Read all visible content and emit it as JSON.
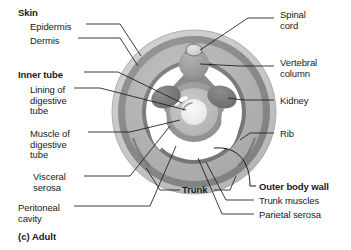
{
  "figure": {
    "caption": "(c) Adult",
    "center_label": "Trunk"
  },
  "colors": {
    "ink": "#1a1a1a",
    "skin_outer": "#c9c9c9",
    "dermis_band": "#8e8e8e",
    "trunk_muscle": "#b4b4b4",
    "parietal_serosa": "#7d7d7d",
    "peritoneal_cavity": "#ffffff",
    "visceral_serosa": "#9a9a9a",
    "digestive_muscle": "#bdbdbd",
    "digestive_lining": "#efefef",
    "organ_dark": "#7a7a7a",
    "vertebral_column": "#a0a0a0",
    "spinal_cord": "#d8d8d8",
    "background": "#ffffff"
  },
  "labels_left": [
    {
      "id": "skin",
      "text": "Skin",
      "bold": true,
      "x": 18,
      "y": 8
    },
    {
      "id": "epidermis",
      "text": "Epidermis",
      "bold": false,
      "x": 30,
      "y": 22
    },
    {
      "id": "dermis",
      "text": "Dermis",
      "bold": false,
      "x": 30,
      "y": 36
    },
    {
      "id": "inner-tube",
      "text": "Inner tube",
      "bold": true,
      "x": 18,
      "y": 70
    },
    {
      "id": "lining-of-digestive-tube",
      "text": "Lining of\ndigestive\ntube",
      "bold": false,
      "x": 30,
      "y": 85
    },
    {
      "id": "muscle-of-digestive-tube",
      "text": "Muscle of\ndigestive\ntube",
      "bold": false,
      "x": 30,
      "y": 129
    },
    {
      "id": "visceral-serosa",
      "text": "Visceral\nserosa",
      "bold": false,
      "x": 33,
      "y": 172
    },
    {
      "id": "peritoneal-cavity",
      "text": "Peritoneal\ncavity",
      "bold": false,
      "x": 18,
      "y": 203
    }
  ],
  "labels_right": [
    {
      "id": "spinal-cord",
      "text": "Spinal\ncord",
      "bold": false,
      "x": 280,
      "y": 10
    },
    {
      "id": "vertebral-column",
      "text": "Vertebral\ncolumn",
      "bold": false,
      "x": 280,
      "y": 58
    },
    {
      "id": "kidney",
      "text": "Kidney",
      "bold": false,
      "x": 280,
      "y": 96
    },
    {
      "id": "rib",
      "text": "Rib",
      "bold": false,
      "x": 280,
      "y": 129
    },
    {
      "id": "outer-body-wall",
      "text": "Outer body wall",
      "bold": true,
      "x": 259,
      "y": 182
    },
    {
      "id": "trunk-muscles",
      "text": "Trunk muscles",
      "bold": false,
      "x": 259,
      "y": 197
    },
    {
      "id": "parietal-serosa",
      "text": "Parietal serosa",
      "bold": false,
      "x": 259,
      "y": 211
    }
  ],
  "diagram": {
    "type": "anatomical-cross-section",
    "center": {
      "cx": 194,
      "cy": 112
    },
    "rings": [
      {
        "name": "skin-epidermis",
        "r": 82,
        "fill": "#c9c9c9"
      },
      {
        "name": "skin-dermis",
        "r": 76,
        "fill": "#8e8e8e"
      },
      {
        "name": "trunk-muscles",
        "r": 69,
        "fill": "#b4b4b4"
      },
      {
        "name": "parietal-serosa",
        "r": 52,
        "fill": "#7d7d7d"
      },
      {
        "name": "peritoneal-cavity",
        "r": 48,
        "fill": "#ffffff"
      },
      {
        "name": "visceral-serosa",
        "r": 30,
        "fill": "#9a9a9a"
      },
      {
        "name": "digestive-muscle",
        "r": 24,
        "fill": "#bdbdbd"
      },
      {
        "name": "digestive-lining",
        "r": 13,
        "fill": "#efefef"
      }
    ],
    "organs": [
      {
        "name": "spinal-cord",
        "cx": 194,
        "cy": 48
      },
      {
        "name": "vertebral-column",
        "cx": 194,
        "cy": 62
      },
      {
        "name": "kidney-left",
        "cx": 166,
        "cy": 98
      },
      {
        "name": "kidney-right",
        "cx": 222,
        "cy": 98
      }
    ]
  }
}
